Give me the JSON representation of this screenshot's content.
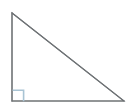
{
  "figure": {
    "kind": "right-triangle-diagram",
    "title": "Right triangle",
    "canvas": {
      "width": 128,
      "height": 109,
      "background_color": "#ffffff"
    },
    "style": {
      "stroke_color": "#6e7275",
      "stroke_width": 1.1,
      "right_angle_marker_fill": "#ffffff",
      "right_angle_marker_stroke": "#a9c4d4",
      "right_angle_marker_stroke_width": 1.6,
      "fill_color": "none"
    },
    "vertices": [
      {
        "name": "apex-top-left",
        "label": "",
        "x": 12,
        "y": 13
      },
      {
        "name": "right-angle-bottom-left",
        "label": "",
        "x": 12,
        "y": 101
      },
      {
        "name": "vertex-bottom-right",
        "label": "",
        "x": 124,
        "y": 101
      }
    ],
    "edges": [
      {
        "name": "vertical-leg",
        "from": "apex-top-left",
        "to": "right-angle-bottom-left",
        "length_px": 88
      },
      {
        "name": "horizontal-leg",
        "from": "right-angle-bottom-left",
        "to": "vertex-bottom-right",
        "length_px": 112
      },
      {
        "name": "hypotenuse",
        "from": "apex-top-left",
        "to": "vertex-bottom-right",
        "length_px": 142
      }
    ],
    "right_angle_marker": {
      "name": "right-angle-square",
      "at_vertex": "right-angle-bottom-left",
      "size_px": 11,
      "x": 12,
      "y": 90,
      "width": 11,
      "height": 11
    },
    "labels": []
  }
}
